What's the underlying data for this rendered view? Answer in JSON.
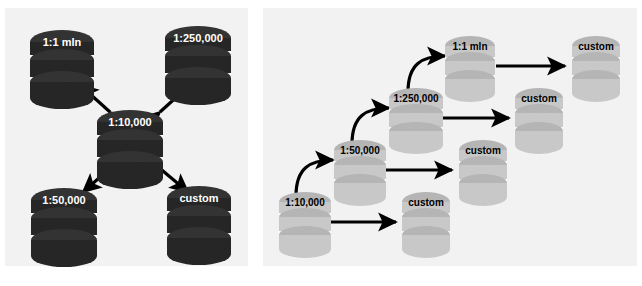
{
  "figure": {
    "panels": [
      {
        "id": "left",
        "name": "star-topology-panel",
        "layout": "star",
        "background": "#f2f2f2",
        "node_style": "dark",
        "node_fill": "#262626",
        "node_text_color": "#ffffff",
        "arrow_color": "#000000",
        "center": {
          "label": "1:10,000",
          "x": 124,
          "y": 118
        },
        "outer": [
          {
            "label": "1:1 mln",
            "x": 62,
            "y": 32,
            "direction": "up-left"
          },
          {
            "label": "1:250,000",
            "x": 196,
            "y": 28,
            "direction": "up-right"
          },
          {
            "label": "1:50,000",
            "x": 62,
            "y": 192,
            "direction": "down-left"
          },
          {
            "label": "custom",
            "x": 196,
            "y": 190,
            "direction": "down-right"
          }
        ],
        "edges": [
          {
            "from": "1:10,000",
            "to": "1:1 mln",
            "style": "straight",
            "arrowheads": "both"
          },
          {
            "from": "1:10,000",
            "to": "1:250,000",
            "style": "straight",
            "arrowheads": "both"
          },
          {
            "from": "1:10,000",
            "to": "1:50,000",
            "style": "straight",
            "arrowheads": "single"
          },
          {
            "from": "1:10,000",
            "to": "custom",
            "style": "straight",
            "arrowheads": "single"
          }
        ]
      },
      {
        "id": "right",
        "name": "cascade-topology-panel",
        "layout": "cascade",
        "background": "#f2f2f2",
        "node_style": "light",
        "node_fill": "#c8c8c8",
        "node_text_color": "#000000",
        "arrow_color": "#000000",
        "chain": [
          {
            "label": "1:10,000",
            "x": 284,
            "y": 196
          },
          {
            "label": "1:50,000",
            "x": 339,
            "y": 144
          },
          {
            "label": "1:250,000",
            "x": 394,
            "y": 92
          },
          {
            "label": "1:1 mln",
            "x": 450,
            "y": 40
          }
        ],
        "custom_nodes": [
          {
            "label": "custom",
            "x": 395,
            "y": 196
          },
          {
            "label": "custom",
            "x": 452,
            "y": 144
          },
          {
            "label": "custom",
            "x": 508,
            "y": 92
          },
          {
            "label": "custom",
            "x": 565,
            "y": 40
          }
        ],
        "edges": [
          {
            "from": "1:10,000",
            "to": "1:50,000",
            "style": "curved",
            "arrowheads": "single"
          },
          {
            "from": "1:50,000",
            "to": "1:250,000",
            "style": "curved",
            "arrowheads": "single"
          },
          {
            "from": "1:250,000",
            "to": "1:1 mln",
            "style": "curved",
            "arrowheads": "single"
          },
          {
            "from": "1:10,000",
            "to": "custom",
            "style": "straight",
            "arrowheads": "single"
          },
          {
            "from": "1:50,000",
            "to": "custom",
            "style": "straight",
            "arrowheads": "single"
          },
          {
            "from": "1:250,000",
            "to": "custom",
            "style": "straight",
            "arrowheads": "single"
          },
          {
            "from": "1:1 mln",
            "to": "custom",
            "style": "straight",
            "arrowheads": "single"
          }
        ]
      }
    ]
  },
  "labels": {
    "left": {
      "center": "1:10,000",
      "top_left": "1:1 mln",
      "top_right": "1:250,000",
      "bottom_left": "1:50,000",
      "bottom_right": "custom"
    },
    "right": {
      "chain_0": "1:10,000",
      "chain_1": "1:50,000",
      "chain_2": "1:250,000",
      "chain_3": "1:1 mln",
      "custom_0": "custom",
      "custom_1": "custom",
      "custom_2": "custom",
      "custom_3": "custom"
    }
  },
  "colors": {
    "panel_bg": "#f2f2f2",
    "page_bg": "#ffffff",
    "dark_node": "#262626",
    "dark_node_top": "#333333",
    "light_node": "#c8c8c8",
    "light_node_top": "#b5b5b5",
    "arrow": "#000000",
    "gap": "#ffffff"
  }
}
